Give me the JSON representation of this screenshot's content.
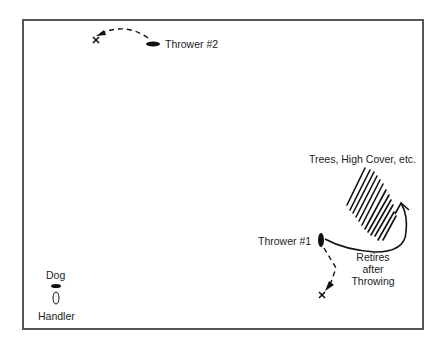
{
  "diagram": {
    "type": "field-layout",
    "labels": {
      "thrower2": "Thrower #2",
      "thrower1": "Thrower #1",
      "cover": "Trees, High Cover, etc.",
      "retires_line1": "Retires",
      "retires_line2": "after",
      "retires_line3": "Throwing",
      "dog": "Dog",
      "handler": "Handler"
    },
    "markers": {
      "fall_mark": "x"
    },
    "colors": {
      "ink": "#111111",
      "frame": "#555555",
      "background": "#ffffff"
    }
  }
}
